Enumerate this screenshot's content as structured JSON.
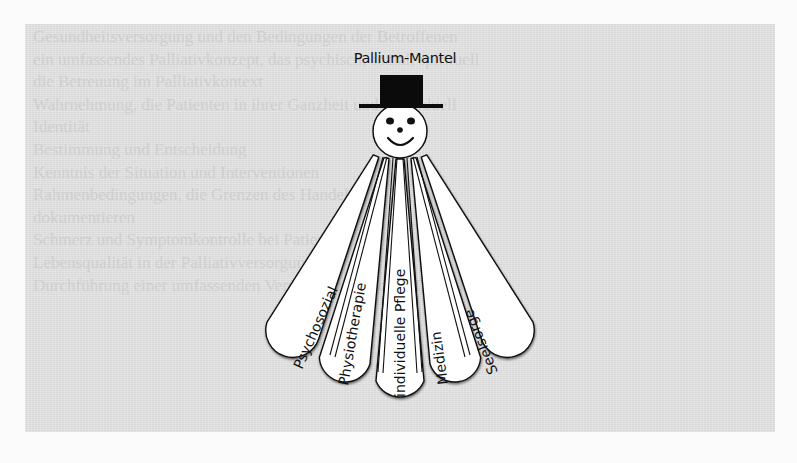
{
  "figure": {
    "title": "Pallium-Mantel",
    "head": {
      "hat": "top-hat-icon",
      "face": "smiley-face-icon"
    },
    "petals": [
      {
        "label": "Psychosozial"
      },
      {
        "label": "Physiotherapie"
      },
      {
        "label": "individuelle Pflege"
      },
      {
        "label": "Medizin"
      },
      {
        "label": "Seelsorge"
      }
    ]
  },
  "background_text": {
    "lines": [
      "Gesundheitsversorgung und den Bedingungen der Betroffenen",
      "ein umfassendes Palliativkonzept, das psychisch, sozial, spirituell",
      "die Betreuung im Palliativkontext",
      "Wahrnehmung, die Patienten in ihrer Ganzheit und individuell",
      "Identität",
      "Bestimmung und Entscheidung",
      "Kenntnis der Situation und Interventionen",
      "Rahmenbedingungen, die Grenzen des Handelns",
      "dokumentieren",
      "Schmerz und Symptomkontrolle bei Patienten",
      "Lebensqualität in der Palliativversorgung",
      "Durchführung einer umfassenden Versorgung zwischen Disziplinen"
    ]
  },
  "colors": {
    "panel": "#e3e3e3",
    "page": "#fbfbfb",
    "ink": "#111111",
    "petal_fill": "#ffffff"
  }
}
